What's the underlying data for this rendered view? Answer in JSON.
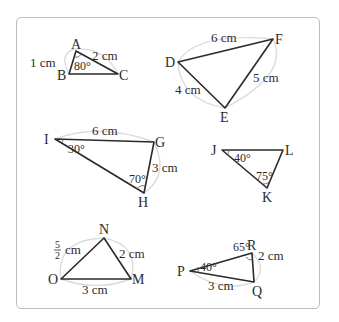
{
  "figure": {
    "frame": {
      "border_color": "#bdbdbd",
      "background": "#ffffff"
    },
    "unit": "cm",
    "triangles": [
      {
        "id": "ABC",
        "vertices": {
          "A": "A",
          "B": "B",
          "C": "C"
        },
        "sides": {
          "AB": "1 cm",
          "AC": "2 cm"
        },
        "angles": {
          "A": "80°"
        }
      },
      {
        "id": "DEF",
        "vertices": {
          "D": "D",
          "E": "E",
          "F": "F"
        },
        "sides": {
          "DF": "6 cm",
          "DE": "4 cm",
          "EF": "5 cm"
        },
        "angles": {}
      },
      {
        "id": "GHI",
        "vertices": {
          "I": "I",
          "G": "G",
          "H": "H"
        },
        "sides": {
          "IG": "6 cm",
          "GH": "3 cm"
        },
        "angles": {
          "I": "30°",
          "H": "70°"
        }
      },
      {
        "id": "JKL",
        "vertices": {
          "J": "J",
          "K": "K",
          "L": "L"
        },
        "sides": {},
        "angles": {
          "J": "40°",
          "K": "75°"
        }
      },
      {
        "id": "MNO",
        "vertices": {
          "N": "N",
          "O": "O",
          "M": "M"
        },
        "sides": {
          "ON": {
            "num": "5",
            "den": "2",
            "unit": "cm"
          },
          "NM": "2 cm",
          "OM": "3 cm"
        },
        "angles": {}
      },
      {
        "id": "PQR",
        "vertices": {
          "P": "P",
          "Q": "Q",
          "R": "R"
        },
        "sides": {
          "RQ": "2 cm",
          "PQ": "3 cm"
        },
        "angles": {
          "P": "40°",
          "R": "65°"
        }
      }
    ]
  }
}
